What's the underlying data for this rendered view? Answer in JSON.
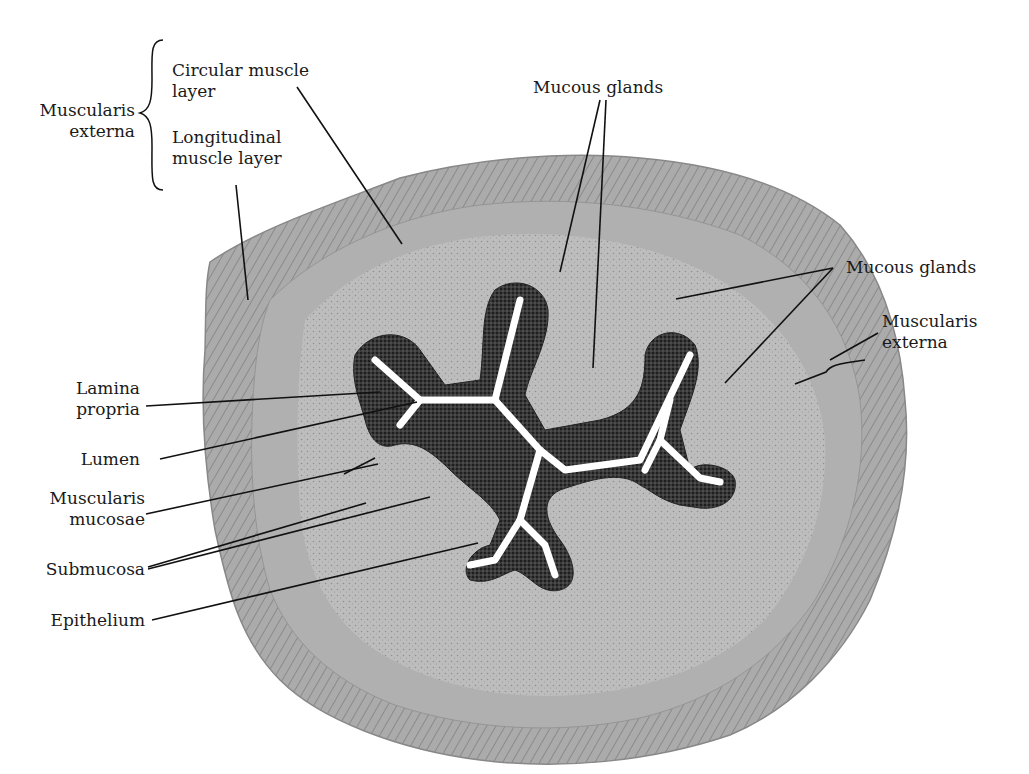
{
  "figure": {
    "colors": {
      "tissue_fill": "#b9b9b9",
      "outer_layer": "#a8a8a8",
      "submucosa": "#c2c2c2",
      "epithelium": "#2a2a2a",
      "lumen": "#ffffff",
      "leader_line": "#111111"
    }
  },
  "labels": {
    "muscularis_externa_top": {
      "line1": "Muscularis",
      "line2": "externa"
    },
    "circular_muscle": {
      "line1": "Circular muscle",
      "line2": "layer"
    },
    "longitudinal_muscle": {
      "line1": "Longitudinal",
      "line2": "muscle layer"
    },
    "mucous_glands_top": {
      "line1": "Mucous glands"
    },
    "mucous_glands_right": {
      "line1": "Mucous glands"
    },
    "muscularis_externa_right": {
      "line1": "Muscularis",
      "line2": "externa"
    },
    "lamina_propria": {
      "line1": "Lamina",
      "line2": "propria"
    },
    "lumen": {
      "line1": "Lumen"
    },
    "muscularis_mucosae": {
      "line1": "Muscularis",
      "line2": "mucosae"
    },
    "submucosa": {
      "line1": "Submucosa"
    },
    "epithelium": {
      "line1": "Epithelium"
    }
  }
}
